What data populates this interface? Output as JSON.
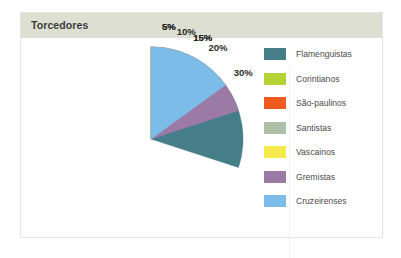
{
  "card": {
    "title": "Torcedores"
  },
  "colors": {
    "title_bar": "#dcdfd2",
    "card_background": "#ffffff",
    "card_border": "#e4e4e0",
    "label_text": "#2b2b2b",
    "legend_text": "#4a4a4a"
  },
  "chart_data": {
    "type": "pie",
    "title": "Torcedores",
    "xlabel": "",
    "ylabel": "",
    "legend_position": "right",
    "start_angle_deg": 0,
    "direction": "clockwise",
    "unit": "%",
    "categories": [
      "Flamenguistas",
      "Corintianos",
      "São-paulinos",
      "Santistas",
      "Vascainos",
      "Gremistas",
      "Cruzeirenses"
    ],
    "values": [
      30,
      15,
      5,
      10,
      5,
      20,
      15
    ],
    "data_labels": [
      "30%",
      "15%",
      "5%",
      "10%",
      "5%",
      "20%",
      "15%"
    ],
    "slice_colors": [
      "#457d89",
      "#b5d334",
      "#f05a1e",
      "#aebfa8",
      "#f5e94e",
      "#9b7ba6",
      "#7cbce8"
    ]
  },
  "legend": {
    "items": [
      {
        "label": "Flamenguistas",
        "color": "#457d89"
      },
      {
        "label": "Corintianos",
        "color": "#b5d334"
      },
      {
        "label": "São-paulinos",
        "color": "#f05a1e"
      },
      {
        "label": "Santistas",
        "color": "#aebfa8"
      },
      {
        "label": "Vascainos",
        "color": "#f5e94e"
      },
      {
        "label": "Gremistas",
        "color": "#9b7ba6"
      },
      {
        "label": "Cruzeirenses",
        "color": "#7cbce8"
      }
    ]
  }
}
